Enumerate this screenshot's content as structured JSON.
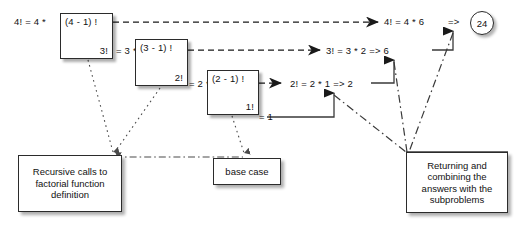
{
  "diagram": {
    "colors": {
      "stroke": "#2b2b2b",
      "background": "#ffffff",
      "text": "#111111"
    },
    "call_frames": [
      {
        "id": "frame-4",
        "top": "(4 - 1) !",
        "bottom": "3!"
      },
      {
        "id": "frame-3",
        "top": "(3 - 1) !",
        "bottom": "2!"
      },
      {
        "id": "frame-2",
        "top": "(2 - 1) !",
        "bottom": "1!"
      }
    ],
    "call_labels": [
      {
        "id": "call-4",
        "text": "4! = 4 *"
      },
      {
        "id": "call-3",
        "text": "= 3 *"
      },
      {
        "id": "call-2",
        "text": "= 2 *"
      },
      {
        "id": "call-1",
        "text": "= 1"
      }
    ],
    "return_labels": [
      {
        "id": "return-4",
        "text": "4! = 4 * 6"
      },
      {
        "id": "return-3",
        "text": "3! = 3 * 2 => 6"
      },
      {
        "id": "return-2",
        "text": "2! = 2 * 1 => 2"
      }
    ],
    "final": {
      "arrow_text": "=>",
      "value": "24"
    },
    "notes": [
      {
        "id": "note-recursive",
        "text": "Recursive calls to factorial function definition"
      },
      {
        "id": "note-base",
        "text": "base case"
      },
      {
        "id": "note-returning",
        "text": "Returning and combining the answers with the subproblems"
      }
    ]
  }
}
